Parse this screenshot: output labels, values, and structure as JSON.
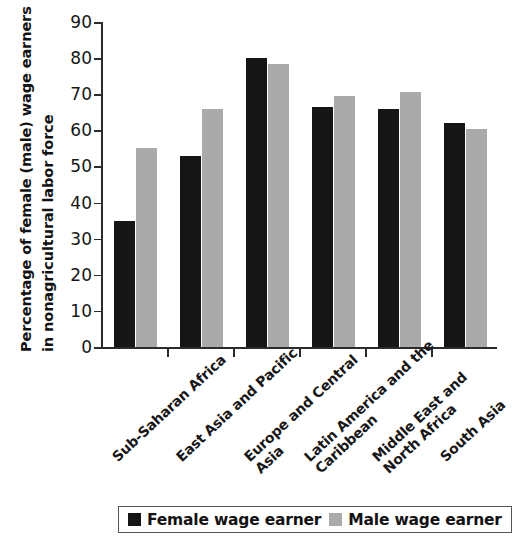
{
  "chart_data": {
    "type": "bar",
    "title": "",
    "subtitle": "",
    "xlabel": "",
    "ylabel_line1": "Percentage of female (male) wage earners",
    "ylabel_line2": "in nonagricultural labor force",
    "ylabel": "Percentage of female (male) wage earners in nonagricultural labor force",
    "ylim": [
      0,
      90
    ],
    "ytick_values": [
      0,
      10,
      20,
      30,
      40,
      50,
      60,
      70,
      80,
      90
    ],
    "ytick_labels": [
      "0",
      "10",
      "20",
      "30",
      "40",
      "50",
      "60",
      "70",
      "80",
      "90"
    ],
    "grid": false,
    "legend_position": "bottom",
    "categories": [
      "Sub-Saharan Africa",
      "East Asia and Pacific",
      "Europe and Central Asia",
      "Latin America and the Caribbean",
      "Middle East and North Africa",
      "South Asia"
    ],
    "category_lines": [
      [
        "Sub-Saharan Africa",
        ""
      ],
      [
        "East Asia and Pacific",
        ""
      ],
      [
        "Europe and Central",
        "Asia"
      ],
      [
        "Latin America and the",
        "Caribbean"
      ],
      [
        "Middle East and",
        "North Africa"
      ],
      [
        "South Asia",
        ""
      ]
    ],
    "series": [
      {
        "name": "Female wage earner",
        "color": "#151515",
        "values": [
          35,
          53,
          80,
          66.5,
          66,
          62
        ]
      },
      {
        "name": "Male wage earner",
        "color": "#aaaaaa",
        "values": [
          55,
          66,
          78.5,
          69.5,
          70.5,
          60.5
        ]
      }
    ]
  },
  "legend": {
    "entries": [
      {
        "label": "Female wage earner",
        "color": "#151515"
      },
      {
        "label": "Male wage earner",
        "color": "#aaaaaa"
      }
    ]
  }
}
